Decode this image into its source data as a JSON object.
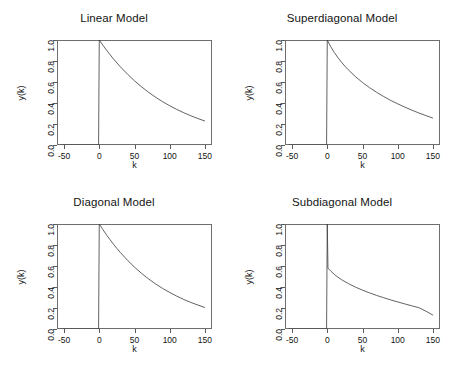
{
  "figure": {
    "background": "#ffffff",
    "line_color": "#3a3a3a",
    "axis_color": "#6e6e6e",
    "layout": "2x2 panel grid"
  },
  "chart_data": [
    {
      "type": "line",
      "title": "Linear Model",
      "xlabel": "k",
      "ylabel": "y(k)",
      "xlim": [
        -60,
        160
      ],
      "ylim": [
        0.0,
        1.0
      ],
      "xticks": [
        -50,
        0,
        50,
        100,
        150
      ],
      "xtick_labels": [
        "-50",
        "0",
        "50",
        "100",
        "150"
      ],
      "yticks": [
        0.0,
        0.2,
        0.4,
        0.6,
        0.8,
        1.0
      ],
      "ytick_labels": [
        "0.0",
        "0.2",
        "0.4",
        "0.6",
        "0.8",
        "1.0"
      ],
      "grid": false,
      "legend": null,
      "description": "Step at k=0 from 0 to 1.0, then smooth exponential decay",
      "x": [
        -55,
        -50,
        -40,
        -30,
        -20,
        -10,
        -1,
        0,
        5,
        10,
        15,
        20,
        25,
        30,
        40,
        50,
        60,
        70,
        80,
        90,
        100,
        110,
        120,
        130,
        140,
        150
      ],
      "y": [
        0.0,
        0.0,
        0.0,
        0.0,
        0.0,
        0.0,
        0.0,
        1.0,
        0.952,
        0.906,
        0.863,
        0.821,
        0.782,
        0.744,
        0.675,
        0.611,
        0.554,
        0.502,
        0.455,
        0.412,
        0.374,
        0.339,
        0.307,
        0.278,
        0.252,
        0.228
      ]
    },
    {
      "type": "line",
      "title": "Superdiagonal Model",
      "xlabel": "k",
      "ylabel": "y(k)",
      "xlim": [
        -60,
        160
      ],
      "ylim": [
        0.0,
        1.0
      ],
      "xticks": [
        -50,
        0,
        50,
        100,
        150
      ],
      "xtick_labels": [
        "-50",
        "0",
        "50",
        "100",
        "150"
      ],
      "yticks": [
        0.0,
        0.2,
        0.4,
        0.6,
        0.8,
        1.0
      ],
      "ytick_labels": [
        "0.0",
        "0.2",
        "0.4",
        "0.6",
        "0.8",
        "1.0"
      ],
      "grid": false,
      "legend": null,
      "description": "Step at k=0 to 1.0, then slightly faster-than-exponential initial decay flattening toward 0.22",
      "x": [
        -55,
        -50,
        -40,
        -30,
        -20,
        -10,
        -1,
        0,
        5,
        10,
        15,
        20,
        25,
        30,
        40,
        50,
        60,
        70,
        80,
        90,
        100,
        110,
        120,
        130,
        140,
        150
      ],
      "y": [
        0.0,
        0.0,
        0.0,
        0.0,
        0.0,
        0.0,
        0.0,
        1.0,
        0.935,
        0.881,
        0.833,
        0.79,
        0.751,
        0.715,
        0.651,
        0.595,
        0.546,
        0.502,
        0.462,
        0.425,
        0.392,
        0.361,
        0.332,
        0.305,
        0.28,
        0.256
      ]
    },
    {
      "type": "line",
      "title": "Diagonal Model",
      "xlabel": "k",
      "ylabel": "y(k)",
      "xlim": [
        -60,
        160
      ],
      "ylim": [
        0.0,
        1.0
      ],
      "xticks": [
        -50,
        0,
        50,
        100,
        150
      ],
      "xtick_labels": [
        "-50",
        "0",
        "50",
        "100",
        "150"
      ],
      "yticks": [
        0.0,
        0.2,
        0.4,
        0.6,
        0.8,
        1.0
      ],
      "ytick_labels": [
        "0.0",
        "0.2",
        "0.4",
        "0.6",
        "0.8",
        "1.0"
      ],
      "grid": false,
      "legend": null,
      "description": "Step at k=0 to 1.0, then exponential decay reaching about 0.21 at k=150",
      "x": [
        -55,
        -50,
        -40,
        -30,
        -20,
        -10,
        -1,
        0,
        5,
        10,
        15,
        20,
        25,
        30,
        40,
        50,
        60,
        70,
        80,
        90,
        100,
        110,
        120,
        130,
        140,
        150
      ],
      "y": [
        0.0,
        0.0,
        0.0,
        0.0,
        0.0,
        0.0,
        0.0,
        1.0,
        0.948,
        0.899,
        0.853,
        0.809,
        0.767,
        0.728,
        0.655,
        0.589,
        0.53,
        0.477,
        0.429,
        0.386,
        0.348,
        0.313,
        0.281,
        0.253,
        0.228,
        0.205
      ]
    },
    {
      "type": "line",
      "title": "Subdiagonal Model",
      "xlabel": "k",
      "ylabel": "y(k)",
      "xlim": [
        -60,
        160
      ],
      "ylim": [
        0.0,
        1.0
      ],
      "xticks": [
        -50,
        0,
        50,
        100,
        150
      ],
      "xtick_labels": [
        "-50",
        "0",
        "50",
        "100",
        "150"
      ],
      "yticks": [
        0.0,
        0.2,
        0.4,
        0.6,
        0.8,
        1.0
      ],
      "ytick_labels": [
        "0.0",
        "0.2",
        "0.4",
        "0.6",
        "0.8",
        "1.0"
      ],
      "grid": false,
      "legend": null,
      "description": "Narrow spike to 1.0 at k=0, immediate drop to about 0.58, then slow decay to about 0.13",
      "x": [
        -55,
        -50,
        -40,
        -30,
        -20,
        -10,
        -1,
        0,
        1,
        3,
        5,
        10,
        15,
        20,
        30,
        40,
        50,
        60,
        70,
        80,
        90,
        100,
        110,
        120,
        130,
        140,
        150
      ],
      "y": [
        0.0,
        0.0,
        0.0,
        0.0,
        0.0,
        0.0,
        0.0,
        1.0,
        0.58,
        0.565,
        0.551,
        0.52,
        0.494,
        0.471,
        0.432,
        0.399,
        0.37,
        0.344,
        0.32,
        0.298,
        0.277,
        0.258,
        0.239,
        0.221,
        0.203,
        0.17,
        0.132
      ]
    }
  ]
}
